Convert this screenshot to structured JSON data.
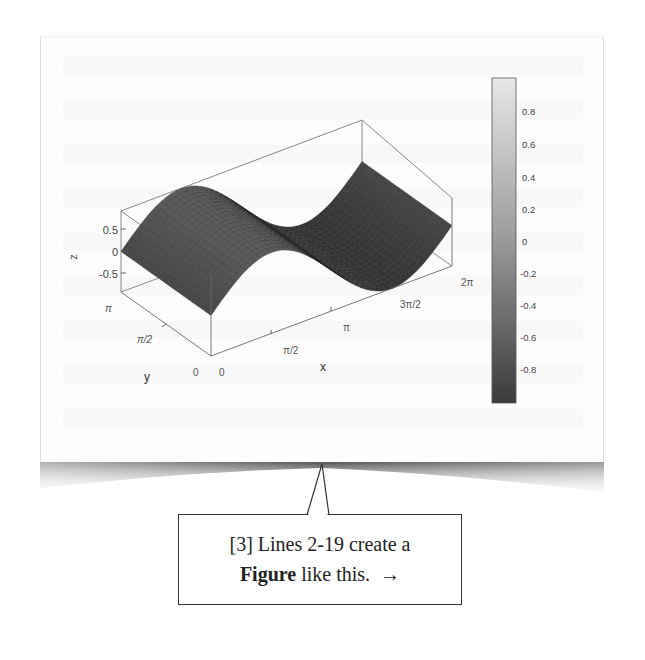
{
  "figure": {
    "colorbar": {
      "ticks": [
        "0.8",
        "0.6",
        "0.4",
        "0.2",
        "0",
        "-0.2",
        "-0.4",
        "-0.6",
        "-0.8"
      ],
      "range": [
        -1,
        1
      ],
      "colormap": "gray",
      "color_top": "#e6e6e6",
      "color_bottom": "#3a3a3a"
    },
    "axes": {
      "x_label": "x",
      "y_label": "y",
      "z_label": "z",
      "x_ticks": [
        "0",
        "π/2",
        "π",
        "3π/2",
        "2π"
      ],
      "y_ticks": [
        "0",
        "π/2",
        "π"
      ],
      "z_ticks": [
        "0.5",
        "0",
        "-0.5"
      ]
    }
  },
  "chart_data": {
    "type": "surface",
    "title": "",
    "function": "z = sin(x)",
    "xlabel": "x",
    "ylabel": "y",
    "zlabel": "z",
    "x_range": [
      0,
      6.2832
    ],
    "y_range": [
      0,
      3.1416
    ],
    "z_range": [
      -1,
      1
    ],
    "x_tick_labels": [
      "0",
      "π/2",
      "π",
      "3π/2",
      "2π"
    ],
    "y_tick_labels": [
      "0",
      "π/2",
      "π"
    ],
    "z_tick_labels": [
      "-0.5",
      "0",
      "0.5"
    ],
    "x": [
      0,
      0.7854,
      1.5708,
      2.3562,
      3.1416,
      3.927,
      4.7124,
      5.4978,
      6.2832
    ],
    "z_profile_along_x": [
      0,
      0.71,
      1.0,
      0.71,
      0,
      -0.71,
      -1.0,
      -0.71,
      0
    ],
    "colorbar_ticks": [
      0.8,
      0.6,
      0.4,
      0.2,
      0,
      -0.2,
      -0.4,
      -0.6,
      -0.8
    ],
    "colormap": "gray",
    "grid": false,
    "box": true
  },
  "callout": {
    "line1": "[3] Lines 2-19 create a",
    "bold": "Figure",
    "line2_rest": " like this.",
    "arrow": "→"
  }
}
